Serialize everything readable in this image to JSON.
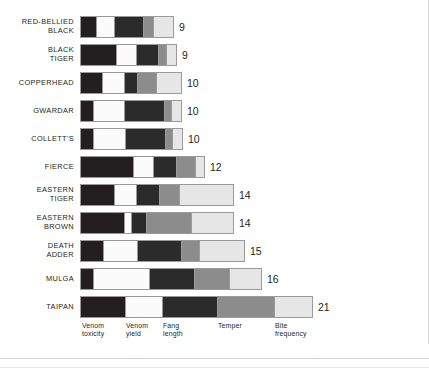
{
  "chart_data": {
    "type": "bar",
    "subtype": "stacked-horizontal",
    "title": "",
    "xlabel": "",
    "ylabel": "",
    "grid": false,
    "legend_position": "bottom",
    "categories": [
      "RED-BELLIED\nBLACK",
      "BLACK\nTIGER",
      "COPPERHEAD",
      "GWARDAR",
      "COLLETT'S",
      "FIERCE",
      "EASTERN\nTIGER",
      "EASTERN\nBROWN",
      "DEATH\nADDER",
      "MULGA",
      "TAIPAN"
    ],
    "series": [
      {
        "name": "Venom toxicity",
        "color": "#231f20",
        "values": [
          15,
          35,
          21,
          12,
          12,
          52,
          33,
          43,
          22,
          12,
          44
        ]
      },
      {
        "name": "Venom yield",
        "color": "#fbfbfb",
        "values": [
          18,
          20,
          22,
          31,
          32,
          20,
          22,
          7,
          34,
          56,
          37
        ]
      },
      {
        "name": "Fang length",
        "color": "#2b2b2b",
        "values": [
          29,
          22,
          13,
          40,
          40,
          23,
          23,
          15,
          44,
          45,
          55
        ]
      },
      {
        "name": "Temper",
        "color": "#8c8c8c",
        "values": [
          10,
          8,
          19,
          7,
          7,
          19,
          20,
          45,
          18,
          35,
          57
        ]
      },
      {
        "name": "Bite frequency",
        "color": "#e6e6e6",
        "values": [
          20,
          10,
          25,
          10,
          10,
          9,
          54,
          42,
          45,
          32,
          38
        ]
      }
    ],
    "totals": [
      9,
      9,
      10,
      10,
      10,
      12,
      14,
      14,
      15,
      16,
      21
    ],
    "total_labels": [
      "9",
      "9",
      "10",
      "10",
      "10",
      "12",
      "14",
      "14",
      "15",
      "16",
      "21"
    ],
    "legend_labels": [
      "Venom\ntoxicity",
      "Venom\nyield",
      "Fang\nlength",
      "Temper",
      "Bite\nfrequency"
    ]
  },
  "colors": {
    "dark": "#231f20",
    "dark2": "#2b2b2b",
    "white": "#fbfbfb",
    "gray": "#8c8c8c",
    "light": "#e6e6e6",
    "outline": "#9a9a9a",
    "text": "#231f20",
    "background": "#ffffff"
  }
}
